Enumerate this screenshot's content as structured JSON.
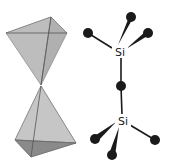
{
  "diagram": {
    "colors": {
      "background": "#ffffff",
      "face_light": "#c4c4c4",
      "face_mid": "#b3b3b3",
      "face_dark": "#8a8a8a",
      "edge": "#555555",
      "atom": "#1a1a1a",
      "bond": "#1a1a1a"
    },
    "polyhedra": {
      "upper": {
        "vertices": {
          "left": [
            6,
            33
          ],
          "back": [
            51,
            17
          ],
          "right": [
            67,
            33
          ],
          "apex": [
            41,
            85
          ]
        }
      },
      "lower": {
        "vertices": {
          "apex": [
            41,
            86
          ],
          "left": [
            15,
            140
          ],
          "front": [
            31,
            157
          ],
          "right": [
            76,
            143
          ]
        }
      }
    },
    "ball_stick": {
      "upper_si": {
        "label": "Si",
        "pos": [
          120,
          52
        ]
      },
      "lower_si": {
        "label": "Si",
        "pos": [
          123,
          121
        ]
      },
      "oxygens": {
        "upper_left": [
          88,
          33
        ],
        "upper_top": [
          131,
          17
        ],
        "upper_right": [
          148,
          33
        ],
        "bridge": [
          121,
          86
        ],
        "lower_left": [
          95,
          139
        ],
        "lower_bottom": [
          112,
          155
        ],
        "lower_right": [
          155,
          140
        ]
      },
      "atom_radius": 5
    }
  }
}
